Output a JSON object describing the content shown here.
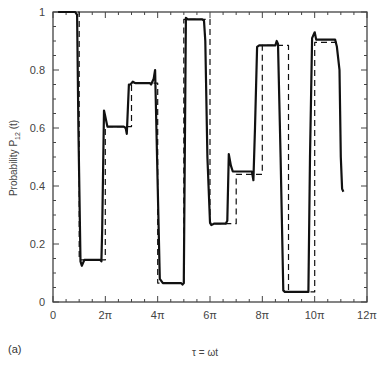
{
  "chart_data": {
    "type": "line",
    "title": "",
    "panel_label": "(a)",
    "xlabel": "τ = ωt",
    "ylabel": "Probability P",
    "ylabel_sub": "12",
    "ylabel_suffix": " (t)",
    "xlim": [
      0,
      12
    ],
    "xlim_units": "π",
    "ylim": [
      0,
      1
    ],
    "grid": false,
    "legend": null,
    "x_ticks": [
      {
        "value": 0,
        "label": "0"
      },
      {
        "value": 2,
        "label": "2π"
      },
      {
        "value": 4,
        "label": "4π"
      },
      {
        "value": 6,
        "label": "6π"
      },
      {
        "value": 8,
        "label": "8π"
      },
      {
        "value": 10,
        "label": "10π"
      },
      {
        "value": 12,
        "label": "12π"
      }
    ],
    "y_ticks": [
      {
        "value": 0,
        "label": "0"
      },
      {
        "value": 0.2,
        "label": "0.2"
      },
      {
        "value": 0.4,
        "label": "0.4"
      },
      {
        "value": 0.6,
        "label": "0.6"
      },
      {
        "value": 0.8,
        "label": "0.8"
      },
      {
        "value": 1,
        "label": "1"
      }
    ],
    "series": [
      {
        "name": "numerical (solid)",
        "style": "solid",
        "color": "#111111",
        "x_in_pi": [
          0.2,
          0.85,
          0.92,
          0.97,
          1.05,
          1.1,
          1.2,
          1.3,
          1.8,
          1.85,
          1.88,
          1.95,
          2.0,
          2.08,
          2.2,
          2.7,
          2.78,
          2.82,
          2.9,
          2.96,
          3.05,
          3.15,
          3.7,
          3.75,
          3.85,
          3.9,
          4.0,
          4.08,
          4.2,
          4.9,
          4.95,
          5.0,
          5.08,
          5.15,
          5.25,
          5.7,
          5.77,
          5.82,
          5.9,
          6.0,
          6.05,
          6.15,
          6.6,
          6.66,
          6.72,
          6.8,
          6.87,
          7.0,
          7.6,
          7.66,
          7.72,
          7.8,
          7.88,
          8.0,
          8.5,
          8.55,
          8.6,
          8.7,
          8.8,
          8.86,
          8.9,
          9.0,
          9.7,
          9.76,
          9.82,
          9.9,
          10.0,
          10.06,
          10.2,
          10.7,
          10.78,
          10.85,
          10.95,
          11.0,
          11.05,
          11.1
        ],
        "y": [
          1.0,
          1.0,
          0.99,
          0.6,
          0.14,
          0.125,
          0.145,
          0.145,
          0.145,
          0.14,
          0.25,
          0.66,
          0.64,
          0.605,
          0.605,
          0.605,
          0.6,
          0.58,
          0.75,
          0.75,
          0.76,
          0.755,
          0.755,
          0.75,
          0.77,
          0.8,
          0.4,
          0.08,
          0.065,
          0.065,
          0.06,
          0.065,
          0.98,
          0.975,
          0.975,
          0.975,
          0.97,
          0.9,
          0.5,
          0.275,
          0.265,
          0.27,
          0.27,
          0.28,
          0.51,
          0.47,
          0.45,
          0.45,
          0.45,
          0.42,
          0.6,
          0.88,
          0.885,
          0.885,
          0.885,
          0.9,
          0.89,
          0.5,
          0.04,
          0.035,
          0.035,
          0.035,
          0.035,
          0.035,
          0.5,
          0.91,
          0.93,
          0.905,
          0.905,
          0.905,
          0.905,
          0.88,
          0.8,
          0.5,
          0.39,
          0.38
        ]
      },
      {
        "name": "approximation (dashed)",
        "style": "dashed",
        "color": "#111111",
        "x_in_pi": [
          0.2,
          1.0,
          1.0,
          2.0,
          2.0,
          3.0,
          3.0,
          4.0,
          4.0,
          5.0,
          5.0,
          6.0,
          6.0,
          7.0,
          7.0,
          8.0,
          8.0,
          9.0,
          9.0,
          10.0,
          10.0,
          11.0
        ],
        "y": [
          1.0,
          1.0,
          0.145,
          0.145,
          0.605,
          0.605,
          0.755,
          0.755,
          0.065,
          0.065,
          0.975,
          0.975,
          0.27,
          0.27,
          0.44,
          0.44,
          0.885,
          0.885,
          0.035,
          0.035,
          0.895,
          0.895
        ]
      }
    ]
  }
}
